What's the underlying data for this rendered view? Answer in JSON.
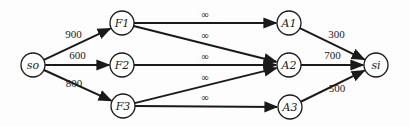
{
  "diagram": {
    "type": "flow-network",
    "nodes": [
      {
        "id": "so",
        "label": "so",
        "x": 33,
        "y": 65
      },
      {
        "id": "F1",
        "label": "F1",
        "x": 122,
        "y": 23
      },
      {
        "id": "F2",
        "label": "F2",
        "x": 122,
        "y": 65
      },
      {
        "id": "F3",
        "label": "F3",
        "x": 123,
        "y": 106
      },
      {
        "id": "A1",
        "label": "A1",
        "x": 289,
        "y": 23
      },
      {
        "id": "A2",
        "label": "A2",
        "x": 289,
        "y": 65
      },
      {
        "id": "A3",
        "label": "A3",
        "x": 290,
        "y": 107
      },
      {
        "id": "si",
        "label": "si",
        "x": 376,
        "y": 65
      }
    ],
    "edges": [
      {
        "from": "so",
        "to": "F1",
        "label": "900"
      },
      {
        "from": "so",
        "to": "F2",
        "label": "600"
      },
      {
        "from": "so",
        "to": "F3",
        "label": "800"
      },
      {
        "from": "F1",
        "to": "A1",
        "label": "∞"
      },
      {
        "from": "F1",
        "to": "A2",
        "label": "∞"
      },
      {
        "from": "F2",
        "to": "A2",
        "label": "∞"
      },
      {
        "from": "F3",
        "to": "A2",
        "label": "∞"
      },
      {
        "from": "F3",
        "to": "A3",
        "label": "∞"
      },
      {
        "from": "A1",
        "to": "si",
        "label": "300"
      },
      {
        "from": "A2",
        "to": "si",
        "label": "700"
      },
      {
        "from": "A3",
        "to": "si",
        "label": "500"
      }
    ]
  }
}
